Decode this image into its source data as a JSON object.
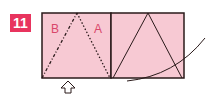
{
  "step": {
    "number": "11",
    "badge_color": "#e8345e"
  },
  "diagram": {
    "paper_color": "#f7c9d3",
    "line_color": "#2a1a1a",
    "labels": {
      "left": "B",
      "right": "A"
    },
    "arrow": "push-up-arrow",
    "curve": "rotation-curve"
  }
}
